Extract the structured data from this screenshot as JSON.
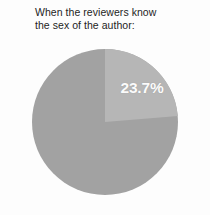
{
  "title": {
    "line1": "When the reviewers know",
    "line2": "the sex of the author:"
  },
  "colors": {
    "background": "#fdfdfd",
    "title_text": "#1d1d1d",
    "slice_highlight": "#b6b6b6",
    "slice_remainder": "#a2a2a2",
    "label_text": "#fbfbfb"
  },
  "chart_data": {
    "type": "pie",
    "title": "When the reviewers know the sex of the author:",
    "subtitle": "",
    "xlabel": "",
    "ylabel": "",
    "legend": "none",
    "grid": false,
    "start_angle_deg": 0,
    "direction": "clockwise",
    "categories": [
      "23.7%",
      "Remainder"
    ],
    "values": [
      23.7,
      76.3
    ],
    "labels_shown": [
      "23.7%"
    ],
    "slices": [
      {
        "label": "23.7%",
        "value": 23.7,
        "color": "#b6b6b6",
        "start_angle_deg": 0,
        "end_angle_deg": 85.3,
        "label_visible": true
      },
      {
        "label": "",
        "value": 76.3,
        "color": "#a2a2a2",
        "start_angle_deg": 85.3,
        "end_angle_deg": 360,
        "label_visible": false
      }
    ]
  }
}
